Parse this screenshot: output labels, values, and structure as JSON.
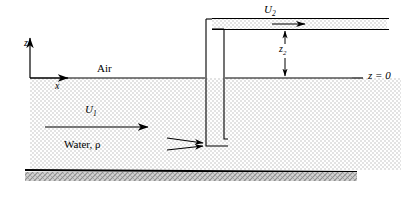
{
  "figure": {
    "type": "fluid-mechanics-schematic",
    "background_color": "#ffffff",
    "line_color": "#000000",
    "fluid_fill_color": "#e8e8e8",
    "bed_fill_color": "#c9c9c9"
  },
  "labels": {
    "z_axis": "z",
    "x_axis": "x",
    "air": "Air",
    "velocity_lower": "U",
    "velocity_lower_sub": "1",
    "velocity_upper": "U",
    "velocity_upper_sub": "2",
    "fluid": "Water, ρ",
    "height": "z",
    "height_sub": "2",
    "datum": "z = 0"
  },
  "elements": {
    "free_surface": "water-free-surface-line",
    "datum_line": "z-equals-zero-reference-line",
    "channel_bed": "hatched-channel-bed",
    "riser_tube": "vertical-riser-tube",
    "tube_inlet": "submerged-tube-inlet",
    "upper_channel": "elevated-discharge-channel",
    "inflow_arrows": "stagnation-inflow-arrows",
    "dimension_arrow": "z2-dimension-double-arrow"
  }
}
